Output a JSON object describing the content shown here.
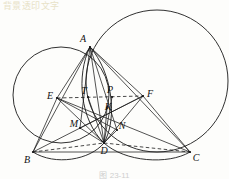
{
  "figure": {
    "caption": "图 23-11",
    "bleed_text": "背景透印文字",
    "stroke_color": "#1a1a1a",
    "background_color": "#fdfdfb",
    "width": 229,
    "height": 179
  },
  "points": [
    {
      "id": "A",
      "label": "A",
      "x": 90,
      "y": 47,
      "label_x": 83,
      "label_y": 39
    },
    {
      "id": "B",
      "label": "B",
      "x": 33,
      "y": 152,
      "label_x": 27,
      "label_y": 160
    },
    {
      "id": "C",
      "label": "C",
      "x": 190,
      "y": 152,
      "label_x": 196,
      "label_y": 158
    },
    {
      "id": "D",
      "label": "D",
      "x": 104,
      "y": 143,
      "label_x": 104,
      "label_y": 151
    },
    {
      "id": "E",
      "label": "E",
      "x": 57,
      "y": 98,
      "label_x": 50,
      "label_y": 96
    },
    {
      "id": "F",
      "label": "F",
      "x": 143,
      "y": 96,
      "label_x": 150,
      "label_y": 94
    },
    {
      "id": "T",
      "label": "T",
      "x": 88,
      "y": 97,
      "label_x": 84,
      "label_y": 91
    },
    {
      "id": "P",
      "label": "P",
      "x": 112,
      "y": 97,
      "label_x": 110,
      "label_y": 90
    },
    {
      "id": "K",
      "label": "K",
      "x": 107,
      "y": 108,
      "label_x": 108,
      "label_y": 107
    },
    {
      "id": "M",
      "label": "M",
      "x": 80,
      "y": 128,
      "label_x": 74,
      "label_y": 124
    },
    {
      "id": "N",
      "label": "N",
      "x": 117,
      "y": 130,
      "label_x": 122,
      "label_y": 126
    }
  ],
  "circles": [
    {
      "name": "circumcircle-left",
      "cx": 61,
      "cy": 95,
      "r": 48
    },
    {
      "name": "circumcircle-right",
      "cx": 157,
      "cy": 81,
      "r": 71
    }
  ],
  "arcs": [
    {
      "name": "arc-A-D-left",
      "d": "M 90 47 C 76 75 80 120 104 143"
    },
    {
      "name": "arc-A-D-right",
      "d": "M 90 47 C 112 72 118 118 104 143"
    },
    {
      "name": "arc-B-D-bottom",
      "d": "M 33 152 C 55 166 90 160 104 143"
    },
    {
      "name": "arc-D-C-bottom",
      "d": "M 104 143 C 125 162 168 165 190 152"
    }
  ],
  "solid_segments": [
    {
      "name": "segment-AB",
      "from": "A",
      "to": "B"
    },
    {
      "name": "segment-AC",
      "from": "A",
      "to": "C"
    },
    {
      "name": "segment-BC",
      "from": "B",
      "to": "C"
    },
    {
      "name": "segment-AD",
      "from": "A",
      "to": "D"
    },
    {
      "name": "segment-EB",
      "from": "E",
      "to": "B"
    },
    {
      "name": "segment-EA",
      "from": "E",
      "to": "A"
    },
    {
      "name": "segment-ED",
      "from": "E",
      "to": "D"
    },
    {
      "name": "segment-EN",
      "from": "E",
      "to": "N"
    },
    {
      "name": "segment-EC",
      "from": "E",
      "to": "C"
    },
    {
      "name": "segment-FA",
      "from": "F",
      "to": "A"
    },
    {
      "name": "segment-FD",
      "from": "F",
      "to": "D"
    },
    {
      "name": "segment-FM",
      "from": "F",
      "to": "M"
    },
    {
      "name": "segment-FB",
      "from": "F",
      "to": "B"
    },
    {
      "name": "segment-FC",
      "from": "F",
      "to": "C"
    },
    {
      "name": "segment-AM",
      "from": "A",
      "to": "M"
    },
    {
      "name": "segment-AN",
      "from": "A",
      "to": "N"
    },
    {
      "name": "segment-TD",
      "from": "T",
      "to": "D"
    },
    {
      "name": "segment-PD",
      "from": "P",
      "to": "D"
    },
    {
      "name": "segment-KD",
      "from": "K",
      "to": "D"
    },
    {
      "name": "segment-MD",
      "from": "M",
      "to": "D"
    },
    {
      "name": "segment-ND",
      "from": "N",
      "to": "D"
    }
  ],
  "dashed_segments": [
    {
      "name": "segment-EF",
      "from": "E",
      "to": "F"
    },
    {
      "name": "segment-BD-dashed",
      "from": "B",
      "to": "D"
    },
    {
      "name": "segment-DC-dashed",
      "from": "D",
      "to": "C"
    }
  ]
}
